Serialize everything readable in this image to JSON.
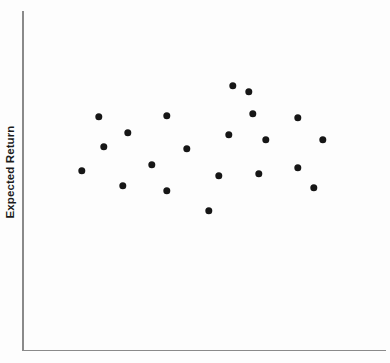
{
  "figure": {
    "background_color": "#fdfdfd",
    "axis_color": "#8a8a8a",
    "marker_color": "#161616"
  },
  "axes": {
    "y_title": "Expected Return",
    "x_title": ""
  },
  "chart_data": {
    "type": "scatter",
    "title": "",
    "xlabel": "",
    "ylabel": "Expected Return",
    "grid": false,
    "legend": null,
    "axis_ticks": {
      "x": [],
      "y": []
    },
    "axis_ranges": {
      "x_pixels": [
        22,
        386
      ],
      "y_pixels": [
        11,
        350
      ]
    },
    "series": [
      {
        "name": "observations",
        "marker": "filled-circle",
        "marker_color": "#161616",
        "marker_size_px": 7.4,
        "points_px": [
          {
            "x": 82,
            "y": 171
          },
          {
            "x": 99,
            "y": 117
          },
          {
            "x": 104,
            "y": 147
          },
          {
            "x": 123,
            "y": 186
          },
          {
            "x": 128,
            "y": 133
          },
          {
            "x": 152,
            "y": 165
          },
          {
            "x": 167,
            "y": 116
          },
          {
            "x": 167,
            "y": 191
          },
          {
            "x": 187,
            "y": 149
          },
          {
            "x": 209,
            "y": 211
          },
          {
            "x": 219,
            "y": 176
          },
          {
            "x": 229,
            "y": 135
          },
          {
            "x": 233,
            "y": 86
          },
          {
            "x": 249,
            "y": 92
          },
          {
            "x": 253,
            "y": 114
          },
          {
            "x": 259,
            "y": 174
          },
          {
            "x": 266,
            "y": 140
          },
          {
            "x": 298,
            "y": 118
          },
          {
            "x": 298,
            "y": 168
          },
          {
            "x": 314,
            "y": 188
          },
          {
            "x": 323,
            "y": 140
          }
        ],
        "point_count": 21
      }
    ]
  }
}
